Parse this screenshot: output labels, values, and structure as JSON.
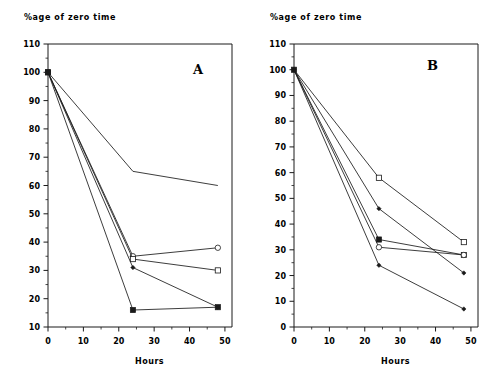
{
  "figure": {
    "width": 492,
    "height": 384,
    "background": "#ffffff",
    "line_color": "#1a1a1a"
  },
  "chart_data": [
    {
      "type": "line",
      "panel": "A",
      "title": "",
      "label": "A",
      "ylabel": "%age of zero time",
      "xlabel": "Hours",
      "xlim": [
        0,
        52
      ],
      "ylim": [
        10,
        110
      ],
      "xticks": [
        0,
        10,
        20,
        30,
        40,
        50
      ],
      "yticks": [
        10,
        20,
        30,
        40,
        50,
        60,
        70,
        80,
        90,
        100,
        110
      ],
      "yminorticks": [
        15,
        25,
        35,
        45,
        55,
        65,
        75,
        85,
        95,
        105
      ],
      "xminorticks": [
        5,
        15,
        25,
        35,
        45
      ],
      "grid": false,
      "legend": "none",
      "x": [
        0,
        24,
        48
      ],
      "series": [
        {
          "name": "series-1",
          "marker": "none",
          "values": [
            100,
            65,
            60
          ]
        },
        {
          "name": "series-2",
          "marker": "open-circle",
          "values": [
            100,
            35,
            38
          ]
        },
        {
          "name": "series-3",
          "marker": "open-square",
          "values": [
            100,
            34,
            30
          ]
        },
        {
          "name": "series-4",
          "marker": "small-diamond",
          "values": [
            100,
            31,
            17
          ]
        },
        {
          "name": "series-5",
          "marker": "filled-square",
          "values": [
            100,
            16,
            17
          ]
        }
      ]
    },
    {
      "type": "line",
      "panel": "B",
      "title": "",
      "label": "B",
      "ylabel": "%age of zero time",
      "xlabel": "Hours",
      "xlim": [
        0,
        52
      ],
      "ylim": [
        0,
        110
      ],
      "xticks": [
        0,
        10,
        20,
        30,
        40,
        50
      ],
      "yticks": [
        0,
        10,
        20,
        30,
        40,
        50,
        60,
        70,
        80,
        90,
        100,
        110
      ],
      "yminorticks": [
        5,
        15,
        25,
        35,
        45,
        55,
        65,
        75,
        85,
        95,
        105
      ],
      "xminorticks": [
        5,
        15,
        25,
        35,
        45
      ],
      "grid": false,
      "legend": "none",
      "x": [
        0,
        24,
        48
      ],
      "series": [
        {
          "name": "series-1",
          "marker": "open-square",
          "values": [
            100,
            58,
            33
          ]
        },
        {
          "name": "series-2",
          "marker": "small-diamond",
          "values": [
            100,
            46,
            21
          ]
        },
        {
          "name": "series-3",
          "marker": "filled-square",
          "values": [
            100,
            34,
            28
          ]
        },
        {
          "name": "series-4",
          "marker": "open-circle",
          "values": [
            100,
            31,
            28
          ]
        },
        {
          "name": "series-5",
          "marker": "small-diamond",
          "values": [
            100,
            24,
            7
          ]
        }
      ]
    }
  ]
}
